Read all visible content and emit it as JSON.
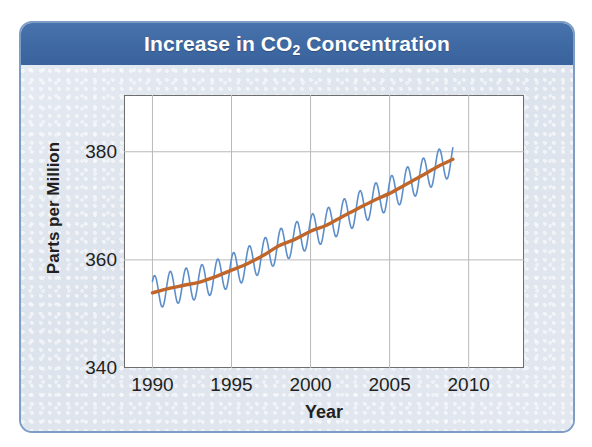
{
  "card": {
    "title_prefix": "Increase in CO",
    "title_subscript": "2",
    "title_suffix": " Concentration",
    "title_full": "Increase in CO2 Concentration",
    "header_color": "#3f69a3",
    "border_color": "#7d9dc6",
    "background_color": "#dfe5ee"
  },
  "chart_data": {
    "type": "line",
    "title": "Increase in CO2 Concentration",
    "xlabel": "Year",
    "ylabel": "Parts per Million",
    "xlim": [
      1988.2,
      2013.5
    ],
    "ylim": [
      340,
      390.5
    ],
    "xticks": [
      1990,
      1995,
      2000,
      2005,
      2010
    ],
    "xtick_labels": [
      "1990",
      "1995",
      "2000",
      "2005",
      "2010"
    ],
    "yticks": [
      340,
      360,
      380
    ],
    "ytick_labels": [
      "340",
      "360",
      "380"
    ],
    "grid": true,
    "grid_color": "#b9b9b9",
    "legend": null,
    "series": [
      {
        "name": "Monthly mean CO2 (seasonal cycle)",
        "color": "#5d8ec9",
        "line_width": 1.6,
        "description": "Oscillating monthly record with annual seasonal cycle, amplitude about 3 ppm",
        "seasonal_amplitude_ppm": 3.1,
        "cycles_per_year": 1,
        "x": [
          1990.0,
          1990.5,
          1991.0,
          1991.5,
          1992.0,
          1992.5,
          1993.0,
          1993.5,
          1994.0,
          1994.5,
          1995.0,
          1995.5,
          1996.0,
          1996.5,
          1997.0,
          1997.5,
          1998.0,
          1998.5,
          1999.0,
          1999.5,
          2000.0,
          2000.5,
          2001.0,
          2001.5,
          2002.0,
          2002.5,
          2003.0,
          2003.5,
          2004.0,
          2004.5,
          2005.0,
          2005.5,
          2006.0,
          2006.5,
          2007.0,
          2007.5,
          2008.0,
          2008.5,
          2009.0
        ],
        "y": [
          356.6,
          351.1,
          357.4,
          352.0,
          358.0,
          352.6,
          358.5,
          353.2,
          359.5,
          354.2,
          360.8,
          355.4,
          362.0,
          356.6,
          363.5,
          358.0,
          365.3,
          359.8,
          366.5,
          361.1,
          368.0,
          362.5,
          369.1,
          363.7,
          370.7,
          365.2,
          372.2,
          366.8,
          373.7,
          368.3,
          375.0,
          369.6,
          376.6,
          371.2,
          378.2,
          372.8,
          379.9,
          374.5,
          381.3
        ]
      },
      {
        "name": "Smoothed trend",
        "color": "#c0662a",
        "line_width": 3.4,
        "description": "Smooth rising trend line through the oscillating data",
        "x": [
          1990,
          1991,
          1992,
          1993,
          1994,
          1995,
          1996,
          1997,
          1998,
          1999,
          2000,
          2001,
          2002,
          2003,
          2004,
          2005,
          2006,
          2007,
          2008,
          2009
        ],
        "y": [
          353.9,
          354.7,
          355.3,
          355.9,
          356.9,
          358.1,
          359.3,
          360.8,
          362.6,
          363.8,
          365.3,
          366.4,
          368.0,
          369.5,
          371.0,
          372.3,
          373.9,
          375.5,
          377.2,
          378.6
        ]
      }
    ],
    "annotations": []
  }
}
